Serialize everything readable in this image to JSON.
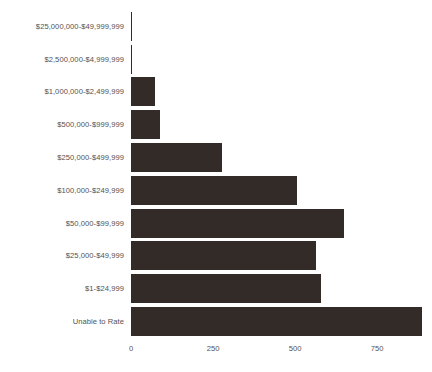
{
  "chart_data": {
    "type": "bar",
    "orientation": "horizontal",
    "title": "",
    "subtitle": "",
    "xlabel": "",
    "ylabel": "",
    "categories": [
      "$25,000,000-$49,999,999",
      "$2,500,000-$4,999,999",
      "$1,000,000-$2,499,999",
      "$500,000-$999,999",
      "$250,000-$499,999",
      "$100,000-$249,999",
      "$50,000-$99,999",
      "$25,000-$49,999",
      "$1-$24,999",
      "Unable to Rate"
    ],
    "values": [
      2,
      4,
      73,
      88,
      277,
      506,
      650,
      564,
      580,
      888
    ],
    "xticks": [
      0,
      250,
      500,
      750
    ],
    "xticklabels": [
      "0",
      "250",
      "500",
      "750"
    ],
    "xlim": [
      0,
      890
    ],
    "grid": false,
    "legend": false,
    "legend_position": "none",
    "bar_color": "#332b28",
    "tick_label_color": "#55514f",
    "background_color": "#ffffff"
  }
}
